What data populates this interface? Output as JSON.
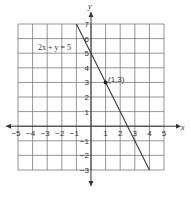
{
  "chart_data": {
    "type": "line",
    "title": "",
    "xlabel": "x",
    "ylabel": "y",
    "xlim": [
      -5,
      5
    ],
    "ylim": [
      -3,
      7
    ],
    "grid": true,
    "x_ticks": [
      -5,
      -4,
      -3,
      -2,
      -1,
      1,
      2,
      3,
      4,
      5
    ],
    "x_tick_labels": [
      "−5",
      "−4",
      "−3",
      "−2",
      "−1",
      "1",
      "2",
      "3",
      "4",
      "5"
    ],
    "y_ticks": [
      7,
      6,
      5,
      4,
      3,
      2,
      1,
      -1,
      -2,
      -3
    ],
    "y_tick_labels": [
      "7",
      "6",
      "5",
      "4",
      "3",
      "2",
      "1",
      "−1",
      "−2",
      "−3"
    ],
    "series": [
      {
        "name": "2x + y = 5",
        "equation": "2x + y = 5",
        "x": [
          -1,
          4
        ],
        "y": [
          7,
          -3
        ]
      }
    ],
    "points": [
      {
        "x": 1,
        "y": 3,
        "label": "(1,3)"
      }
    ],
    "annotations": [
      {
        "text": "2x + y = 5"
      },
      {
        "text": "(1,3)"
      }
    ]
  }
}
